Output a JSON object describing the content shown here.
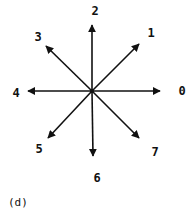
{
  "figure": {
    "caption": "(d)",
    "center": [
      92,
      91
    ],
    "stroke_color": "#111111",
    "directions": [
      {
        "code": "0",
        "angle_deg": 0,
        "tip": [
          160,
          91
        ],
        "label_pos": [
          182,
          95
        ]
      },
      {
        "code": "1",
        "angle_deg": 45,
        "tip": [
          139,
          44
        ],
        "label_pos": [
          151,
          37
        ]
      },
      {
        "code": "2",
        "angle_deg": 90,
        "tip": [
          92,
          25
        ],
        "label_pos": [
          95,
          15
        ]
      },
      {
        "code": "3",
        "angle_deg": 135,
        "tip": [
          46,
          46
        ],
        "label_pos": [
          38,
          41
        ]
      },
      {
        "code": "4",
        "angle_deg": 180,
        "tip": [
          28,
          91
        ],
        "label_pos": [
          16,
          97
        ]
      },
      {
        "code": "5",
        "angle_deg": 225,
        "tip": [
          48,
          138
        ],
        "label_pos": [
          39,
          153
        ]
      },
      {
        "code": "6",
        "angle_deg": 270,
        "tip": [
          93,
          156
        ],
        "label_pos": [
          97,
          182
        ]
      },
      {
        "code": "7",
        "angle_deg": 315,
        "tip": [
          139,
          138
        ],
        "label_pos": [
          155,
          156
        ]
      }
    ]
  }
}
